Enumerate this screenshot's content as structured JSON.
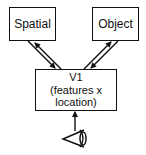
{
  "diagram": {
    "nodes": {
      "spatial": {
        "label": "Spatial"
      },
      "object": {
        "label": "Object"
      },
      "v1": {
        "title": "V1",
        "line1": "(features x",
        "line2": "location)"
      }
    },
    "edges": [
      {
        "from": "v1",
        "to": "spatial",
        "style": "arrow"
      },
      {
        "from": "spatial",
        "to": "v1",
        "style": "arrow"
      },
      {
        "from": "v1",
        "to": "object",
        "style": "arrow"
      },
      {
        "from": "object",
        "to": "v1",
        "style": "arrow"
      },
      {
        "from": "eye",
        "to": "v1",
        "style": "arrow"
      }
    ],
    "input_icon": "eye-icon",
    "colors": {
      "stroke": "#111111",
      "background": "#ffffff"
    }
  }
}
